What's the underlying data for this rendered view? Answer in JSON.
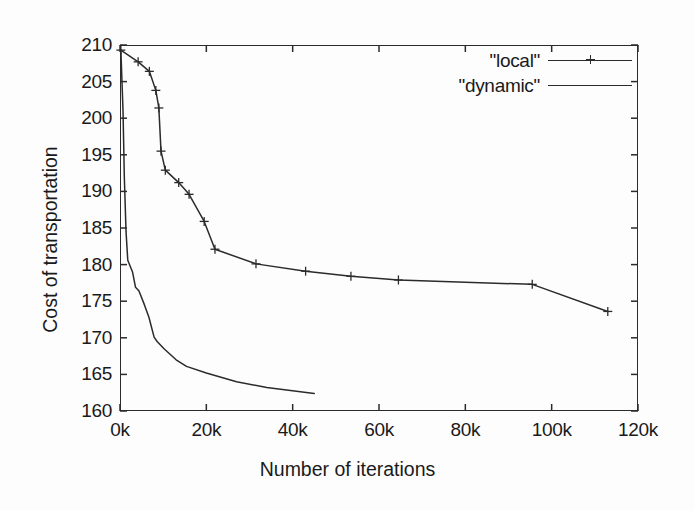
{
  "chart_data": {
    "type": "line",
    "title": "",
    "xlabel": "Number of iterations",
    "ylabel": "Cost of transportation",
    "xlim": [
      0,
      120000
    ],
    "ylim": [
      160,
      210
    ],
    "grid": false,
    "legend_position": "top-right",
    "xticks": [
      {
        "value": 0,
        "label": "0k"
      },
      {
        "value": 20000,
        "label": "20k"
      },
      {
        "value": 40000,
        "label": "40k"
      },
      {
        "value": 60000,
        "label": "60k"
      },
      {
        "value": 80000,
        "label": "80k"
      },
      {
        "value": 100000,
        "label": "100k"
      },
      {
        "value": 120000,
        "label": "120k"
      }
    ],
    "yticks": [
      {
        "value": 210,
        "label": "210"
      },
      {
        "value": 205,
        "label": "205"
      },
      {
        "value": 200,
        "label": "200"
      },
      {
        "value": 195,
        "label": "195"
      },
      {
        "value": 190,
        "label": "190"
      },
      {
        "value": 185,
        "label": "185"
      },
      {
        "value": 180,
        "label": "180"
      },
      {
        "value": 175,
        "label": "175"
      },
      {
        "value": 170,
        "label": "170"
      },
      {
        "value": 165,
        "label": "165"
      },
      {
        "value": 160,
        "label": "160"
      }
    ],
    "series": [
      {
        "name": "\"local\"",
        "marker": "plus",
        "color": "#2b2b2b",
        "points": [
          [
            200,
            209.3
          ],
          [
            4200,
            207.7
          ],
          [
            6800,
            206.4
          ],
          [
            8300,
            203.8
          ],
          [
            9000,
            201.4
          ],
          [
            9500,
            195.5
          ],
          [
            10500,
            192.9
          ],
          [
            13600,
            191.2
          ],
          [
            16000,
            189.6
          ],
          [
            19500,
            185.9
          ],
          [
            22000,
            182.1
          ],
          [
            31500,
            180.1
          ],
          [
            43000,
            179.1
          ],
          [
            53500,
            178.4
          ],
          [
            64500,
            177.9
          ],
          [
            95500,
            177.3
          ],
          [
            113000,
            173.6
          ]
        ]
      },
      {
        "name": "\"dynamic\"",
        "marker": "none",
        "color": "#2b2b2b",
        "points": [
          [
            200,
            209.3
          ],
          [
            700,
            201.0
          ],
          [
            1000,
            192.0
          ],
          [
            1400,
            184.5
          ],
          [
            1800,
            180.6
          ],
          [
            2900,
            179.0
          ],
          [
            3600,
            176.9
          ],
          [
            4400,
            176.4
          ],
          [
            5600,
            174.6
          ],
          [
            6700,
            172.8
          ],
          [
            7900,
            170.1
          ],
          [
            8600,
            169.5
          ],
          [
            10200,
            168.5
          ],
          [
            13000,
            167.0
          ],
          [
            15400,
            166.1
          ],
          [
            20000,
            165.2
          ],
          [
            27000,
            164.0
          ],
          [
            34000,
            163.2
          ],
          [
            45000,
            162.4
          ]
        ]
      }
    ]
  },
  "legend": {
    "entries": [
      {
        "label": "\"local\"",
        "marker": "plus"
      },
      {
        "label": "\"dynamic\"",
        "marker": "none"
      }
    ]
  }
}
